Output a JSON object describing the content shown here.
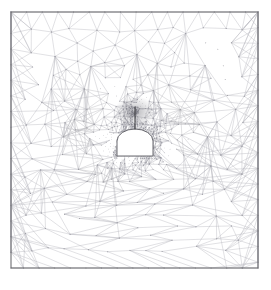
{
  "figure": {
    "type": "mesh-plot",
    "background_color": "#ffffff",
    "width": 271,
    "height": 290
  },
  "domain": {
    "name": "rock-mass-domain",
    "shape": "square",
    "x": 11,
    "y": 12,
    "width": 247,
    "height": 256,
    "border_color": "#6e6e72",
    "border_width": 1.1,
    "fill_color": "#ffffff"
  },
  "mesh": {
    "element_type": "triangle",
    "edge_color": "#9a9aa2",
    "edge_color_dense": "#7b7b84",
    "edge_width_coarse": 0.38,
    "edge_width_fine": 0.3,
    "node_color": "#8d8d96",
    "refinement_description": "concentric refinement bands increasing toward the cavity",
    "bands": [
      {
        "name": "outer-coarse",
        "cell_size": 17.0
      },
      {
        "name": "transition-1",
        "cell_size": 11.5
      },
      {
        "name": "transition-2",
        "cell_size": 7.6
      },
      {
        "name": "transition-3",
        "cell_size": 5.0
      },
      {
        "name": "near-field",
        "cell_size": 3.2
      },
      {
        "name": "cavity-skin",
        "cell_size": 2.1
      },
      {
        "name": "crack-tip-cluster",
        "cell_size": 1.15
      }
    ]
  },
  "cavity": {
    "name": "tunnel-opening",
    "shape": "horseshoe",
    "center_x": 135,
    "floor_y": 156,
    "half_width": 18,
    "wall_top_y": 141,
    "crown_y": 129,
    "fill_color": "#ffffff",
    "outline_color": "#6a6a70",
    "outline_width": 1.0
  },
  "crack": {
    "name": "vertical-crack",
    "x": 135,
    "top_y": 106.5,
    "bottom_y": 129.5,
    "color": "#3a3a3e",
    "width": 1.0
  },
  "crack_tip_cloud": {
    "name": "crack-tip-refinement-cloud",
    "center_x": 135,
    "center_y": 112,
    "radius_x": 21,
    "radius_y": 16,
    "density": "very-high",
    "shade": "#6d6d76"
  },
  "chart_data": {
    "type": "mesh",
    "xlabel": "",
    "ylabel": "",
    "grid": false,
    "legend": "none",
    "xlim": [
      11,
      258
    ],
    "ylim": [
      12,
      268
    ],
    "annotations": [
      "Square rock-mass domain with outlined boundary",
      "Horseshoe (D-shaped) tunnel cavity void at the centre",
      "Vertical crack emanating upward from the tunnel crown",
      "Strong mesh grading: extremely fine elements at the crack tip, coarse elements at the domain edges"
    ],
    "refinement_levels": [
      {
        "band": "outer-coarse",
        "approx_cell_px": 17.0,
        "distance_from_cavity_px": 110
      },
      {
        "band": "transition-1",
        "approx_cell_px": 11.5,
        "distance_from_cavity_px": 85
      },
      {
        "band": "transition-2",
        "approx_cell_px": 7.6,
        "distance_from_cavity_px": 62
      },
      {
        "band": "transition-3",
        "approx_cell_px": 5.0,
        "distance_from_cavity_px": 45
      },
      {
        "band": "near-field",
        "approx_cell_px": 3.2,
        "distance_from_cavity_px": 30
      },
      {
        "band": "cavity-skin",
        "approx_cell_px": 2.1,
        "distance_from_cavity_px": 14
      },
      {
        "band": "crack-tip-cluster",
        "approx_cell_px": 1.15,
        "distance_from_cavity_px": 0
      }
    ]
  }
}
